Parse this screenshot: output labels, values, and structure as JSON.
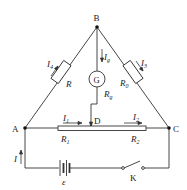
{
  "diagram": {
    "type": "Wheatstone bridge circuit (slide-wire)",
    "nodes": {
      "B": "B",
      "A": "A",
      "C": "C",
      "D": "D"
    },
    "components": {
      "R": {
        "label": "R",
        "current": "I",
        "current_sub": "4"
      },
      "R0": {
        "label": "R",
        "sub": "0",
        "current": "I",
        "current_sub": "3"
      },
      "G": {
        "label": "G",
        "resistance": "R",
        "resistance_sub": "g",
        "current": "I",
        "current_sub": "g"
      },
      "R1": {
        "label": "R",
        "sub": "1",
        "current": "I",
        "current_sub": "1"
      },
      "R2": {
        "label": "R",
        "sub": "2",
        "current": "I",
        "current_sub": "2"
      },
      "battery": {
        "label": "ε"
      },
      "switch": {
        "label": "K"
      },
      "main_current": {
        "label": "I"
      }
    },
    "colors": {
      "line": "#333333",
      "rod_fill": "#ffffff"
    }
  }
}
